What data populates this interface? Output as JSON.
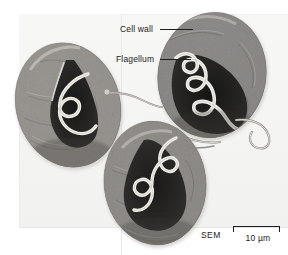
{
  "figure": {
    "type": "scanning-electron-micrograph",
    "background_color": "#ffffff",
    "plate_tint": "#f4f4f2",
    "ink_color": "#1b1b1b"
  },
  "annotations": [
    {
      "id": "cell-wall",
      "label": "Cell wall",
      "leader": "line-to-right"
    },
    {
      "id": "flagellum",
      "label": "Flagellum",
      "leader": "line-to-right"
    }
  ],
  "scale": {
    "technique": "SEM",
    "bar_value": "10 µm"
  },
  "specimens": [
    {
      "id": "cell-left",
      "feature": "cell-body-with-coiled-flagellum"
    },
    {
      "id": "cell-right",
      "feature": "cell-body-with-coiled-flagellum"
    },
    {
      "id": "cell-bottom",
      "feature": "cell-body-with-coiled-flagellum"
    }
  ]
}
